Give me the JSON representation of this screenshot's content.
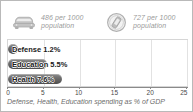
{
  "card": {
    "border_color": "#b9b9b9",
    "background": "#ffffff"
  },
  "stats": [
    {
      "icon": "car-icon",
      "value": "486",
      "text": "486 per 1000\npopulation"
    },
    {
      "icon": "mobile-phone-icon",
      "value": "727",
      "text": "727 per 1000\npopulation"
    }
  ],
  "caption": "Defense, Health, Education spending as % of GDP",
  "chart_data": {
    "type": "bar",
    "orientation": "horizontal",
    "title": "",
    "subtitle": "",
    "xlabel": "",
    "ylabel": "",
    "categories": [
      "Defense",
      "Education",
      "Health"
    ],
    "values": [
      1.2,
      5.5,
      7.6
    ],
    "value_suffix": "%",
    "labels": [
      "Defense 1.2%",
      "Education 5.5%",
      "Health 7.6%"
    ],
    "xlim": [
      0,
      25
    ],
    "xticks": [
      0,
      5,
      10,
      15,
      20,
      25
    ],
    "xtick_labels": [
      "0",
      "5",
      "10",
      "15",
      "20",
      "25"
    ],
    "grid": true,
    "legend": false,
    "bar_color": "#5f5f5f",
    "gridline_color": "#e2e2e2"
  }
}
